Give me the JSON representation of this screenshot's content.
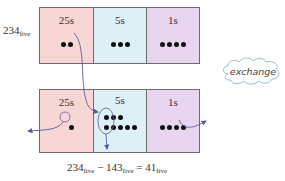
{
  "top_row": {
    "number_label": "234",
    "number_base": "five",
    "cells": [
      {
        "label": "25s",
        "dot_count": 2,
        "color": "#f8d6d6"
      },
      {
        "label": "5s",
        "dot_count": 3,
        "color": "#ddf0f5"
      },
      {
        "label": "1s",
        "dot_count": 4,
        "color": "#e8d6f0"
      }
    ]
  },
  "bottom_row": {
    "cells": [
      {
        "label": "25s",
        "dot_count": 1,
        "circled": 1
      },
      {
        "label": "5s",
        "dot_count": 8,
        "circled": 4
      },
      {
        "label": "1s",
        "dot_count": 4,
        "circled": 3
      }
    ]
  },
  "cloud": {
    "text": "exchange"
  },
  "equation": {
    "a": "234",
    "a_base": "five",
    "op": "−",
    "b": "143",
    "b_base": "five",
    "eq": "=",
    "result": "41",
    "result_base": "five"
  },
  "colors": {
    "arrow": "#5a5a9a",
    "border": "#6e6a6e"
  }
}
